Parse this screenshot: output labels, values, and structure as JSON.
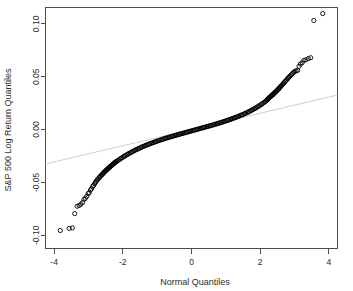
{
  "figure": {
    "background_color": "#ffffff",
    "frame_color": "#4d4d4d",
    "point_color": "#000000",
    "reference_line_color": "#cfcfcf"
  },
  "chart_data": {
    "type": "scatter",
    "title": "",
    "subtitle": "",
    "xlabel": "Normal Quantiles",
    "ylabel": "S&P 500 Log Return Quantiles",
    "xlim": [
      -4.25,
      4.25
    ],
    "ylim": [
      -0.1125,
      0.1155
    ],
    "xticks": [
      -4,
      -2,
      0,
      2,
      4
    ],
    "xtick_labels": [
      "-4",
      "-2",
      "0",
      "2",
      "4"
    ],
    "yticks": [
      -0.1,
      -0.05,
      0.0,
      0.05,
      0.1
    ],
    "ytick_labels": [
      "-0.10",
      "-0.05",
      "0.00",
      "0.05",
      "0.10"
    ],
    "grid": false,
    "legend": null,
    "marker": "open-circle",
    "marker_size": 2.1,
    "annotations": [],
    "reference_line": {
      "name": "qqline",
      "style": "solid",
      "color": "#cfcfcf",
      "x": [
        -4.25,
        4.25
      ],
      "y": [
        -0.0325,
        0.0327
      ]
    },
    "series": [
      {
        "name": "S&P 500 log returns",
        "x": [
          -3.82,
          -3.56,
          -3.47,
          -3.4,
          -3.33,
          -3.27,
          -3.22,
          -3.17,
          -3.13,
          -3.09,
          -3.05,
          -3.01,
          -2.98,
          -2.94,
          -2.91,
          -2.88,
          -2.85,
          -2.82,
          -2.8,
          -2.77,
          -2.74,
          -2.72,
          -2.69,
          -2.67,
          -2.65,
          -2.62,
          -2.6,
          -2.58,
          -2.56,
          -2.54,
          -2.52,
          -2.5,
          -2.48,
          -2.46,
          -2.44,
          -2.42,
          -2.4,
          -2.38,
          -2.37,
          -2.35,
          -2.33,
          -2.31,
          -2.3,
          -2.28,
          -2.26,
          -2.25,
          -2.23,
          -2.22,
          -2.2,
          -2.18,
          -2.15,
          -2.12,
          -2.08,
          -2.05,
          -2.02,
          -1.98,
          -1.95,
          -1.92,
          -1.88,
          -1.85,
          -1.82,
          -1.78,
          -1.75,
          -1.72,
          -1.68,
          -1.65,
          -1.62,
          -1.58,
          -1.55,
          -1.52,
          -1.48,
          -1.45,
          -1.42,
          -1.38,
          -1.35,
          -1.32,
          -1.28,
          -1.25,
          -1.22,
          -1.18,
          -1.15,
          -1.12,
          -1.08,
          -1.05,
          -1.02,
          -0.98,
          -0.95,
          -0.92,
          -0.88,
          -0.85,
          -0.82,
          -0.78,
          -0.75,
          -0.72,
          -0.68,
          -0.65,
          -0.62,
          -0.58,
          -0.55,
          -0.52,
          -0.48,
          -0.45,
          -0.42,
          -0.38,
          -0.35,
          -0.32,
          -0.28,
          -0.25,
          -0.22,
          -0.18,
          -0.15,
          -0.12,
          -0.08,
          -0.05,
          -0.02,
          0.02,
          0.05,
          0.08,
          0.12,
          0.15,
          0.18,
          0.22,
          0.25,
          0.28,
          0.32,
          0.35,
          0.38,
          0.42,
          0.45,
          0.48,
          0.52,
          0.55,
          0.58,
          0.62,
          0.65,
          0.68,
          0.72,
          0.75,
          0.78,
          0.82,
          0.85,
          0.88,
          0.92,
          0.95,
          0.98,
          1.02,
          1.05,
          1.08,
          1.12,
          1.15,
          1.18,
          1.22,
          1.25,
          1.28,
          1.32,
          1.35,
          1.38,
          1.42,
          1.45,
          1.48,
          1.52,
          1.55,
          1.58,
          1.62,
          1.65,
          1.68,
          1.72,
          1.75,
          1.78,
          1.82,
          1.85,
          1.88,
          1.92,
          1.95,
          1.98,
          2.02,
          2.05,
          2.08,
          2.12,
          2.15,
          2.18,
          2.2,
          2.22,
          2.23,
          2.25,
          2.26,
          2.28,
          2.3,
          2.31,
          2.33,
          2.35,
          2.37,
          2.38,
          2.4,
          2.42,
          2.44,
          2.46,
          2.48,
          2.5,
          2.52,
          2.54,
          2.56,
          2.58,
          2.6,
          2.62,
          2.65,
          2.67,
          2.69,
          2.72,
          2.74,
          2.77,
          2.8,
          2.82,
          2.85,
          2.88,
          2.91,
          2.94,
          2.98,
          3.01,
          3.05,
          3.09,
          3.13,
          3.17,
          3.22,
          3.27,
          3.33,
          3.4,
          3.47,
          3.56,
          3.82
        ],
        "y": [
          -0.0955,
          -0.0935,
          -0.093,
          -0.0795,
          -0.0725,
          -0.0718,
          -0.0705,
          -0.069,
          -0.066,
          -0.065,
          -0.0632,
          -0.0605,
          -0.0598,
          -0.0572,
          -0.056,
          -0.054,
          -0.0528,
          -0.0512,
          -0.05,
          -0.0488,
          -0.0475,
          -0.0466,
          -0.0456,
          -0.0448,
          -0.044,
          -0.0432,
          -0.0424,
          -0.0417,
          -0.041,
          -0.0403,
          -0.0396,
          -0.039,
          -0.0384,
          -0.0378,
          -0.0372,
          -0.0366,
          -0.0361,
          -0.0355,
          -0.035,
          -0.0345,
          -0.034,
          -0.0335,
          -0.0331,
          -0.0326,
          -0.0322,
          -0.0317,
          -0.0313,
          -0.0309,
          -0.0305,
          -0.0301,
          -0.0294,
          -0.0287,
          -0.0279,
          -0.0272,
          -0.0265,
          -0.0258,
          -0.0251,
          -0.0245,
          -0.0238,
          -0.0232,
          -0.0226,
          -0.022,
          -0.0214,
          -0.0208,
          -0.0202,
          -0.0197,
          -0.0191,
          -0.0186,
          -0.0181,
          -0.0176,
          -0.0171,
          -0.0166,
          -0.0161,
          -0.0157,
          -0.0152,
          -0.0148,
          -0.0143,
          -0.0139,
          -0.0135,
          -0.0131,
          -0.0127,
          -0.0123,
          -0.0119,
          -0.0115,
          -0.0111,
          -0.0107,
          -0.0104,
          -0.01,
          -0.0096,
          -0.0093,
          -0.0089,
          -0.0086,
          -0.0082,
          -0.0079,
          -0.0076,
          -0.0072,
          -0.0069,
          -0.0066,
          -0.0063,
          -0.0059,
          -0.0056,
          -0.0053,
          -0.005,
          -0.0047,
          -0.0044,
          -0.0041,
          -0.0038,
          -0.0035,
          -0.0032,
          -0.0029,
          -0.0026,
          -0.0023,
          -0.002,
          -0.0017,
          -0.0014,
          -0.0011,
          -0.0008,
          -0.0005,
          -0.0002,
          0.0001,
          0.0004,
          0.0007,
          0.001,
          0.0013,
          0.0016,
          0.0019,
          0.0022,
          0.0025,
          0.0028,
          0.0031,
          0.0034,
          0.0037,
          0.004,
          0.0043,
          0.0046,
          0.005,
          0.0053,
          0.0056,
          0.006,
          0.0063,
          0.0066,
          0.007,
          0.0073,
          0.0077,
          0.008,
          0.0084,
          0.0088,
          0.0091,
          0.0095,
          0.0099,
          0.0103,
          0.0107,
          0.0111,
          0.0115,
          0.0119,
          0.0123,
          0.0128,
          0.0132,
          0.0137,
          0.0141,
          0.0146,
          0.0151,
          0.0156,
          0.0161,
          0.0166,
          0.0172,
          0.0177,
          0.0183,
          0.0189,
          0.0195,
          0.0201,
          0.0207,
          0.0214,
          0.0221,
          0.0228,
          0.0235,
          0.0242,
          0.025,
          0.0258,
          0.0266,
          0.0274,
          0.0281,
          0.0288,
          0.0292,
          0.0297,
          0.0301,
          0.0306,
          0.0311,
          0.0315,
          0.032,
          0.0326,
          0.0331,
          0.0336,
          0.0342,
          0.0348,
          0.0354,
          0.036,
          0.0366,
          0.0373,
          0.038,
          0.0387,
          0.0394,
          0.0401,
          0.0409,
          0.0417,
          0.0426,
          0.0434,
          0.0443,
          0.0452,
          0.0461,
          0.0471,
          0.0481,
          0.049,
          0.05,
          0.051,
          0.052,
          0.0531,
          0.0542,
          0.0551,
          0.0556,
          0.056,
          0.0598,
          0.062,
          0.0632,
          0.0655,
          0.066,
          0.0672,
          0.068,
          0.1032,
          0.1098
        ]
      }
    ]
  }
}
